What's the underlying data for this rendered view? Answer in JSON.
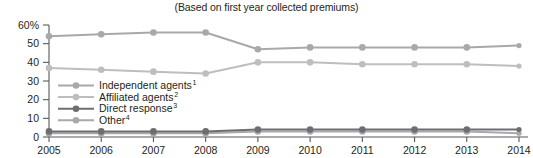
{
  "chart_data": {
    "type": "line",
    "title": "(Based on first year collected premiums)",
    "xlabel": "",
    "ylabel": "",
    "grid": false,
    "legend_position": "inside-left",
    "x": [
      2005,
      2006,
      2007,
      2008,
      2009,
      2010,
      2011,
      2012,
      2013,
      2014
    ],
    "categories": [
      "2005",
      "2006",
      "2007",
      "2008",
      "2009",
      "2010",
      "2011",
      "2012",
      "2013",
      "2014"
    ],
    "ylim": [
      0,
      60
    ],
    "yticks": [
      0,
      10,
      20,
      30,
      40,
      50,
      60
    ],
    "ytick_labels": [
      "0",
      "10",
      "20",
      "30",
      "40",
      "50",
      "60%"
    ],
    "series": [
      {
        "name": "Independent agents",
        "footnote": "1",
        "color": "#a7a9ac",
        "values": [
          54,
          55,
          56,
          56,
          47,
          48,
          48,
          48,
          48,
          49
        ]
      },
      {
        "name": "Affiliated agents",
        "footnote": "2",
        "color": "#bcbec0",
        "values": [
          37,
          36,
          35,
          34,
          40,
          40,
          39,
          39,
          39,
          38
        ]
      },
      {
        "name": "Direct response",
        "footnote": "3",
        "color": "#6d6e71",
        "values": [
          3,
          3,
          3,
          3,
          4,
          4,
          4,
          4,
          4,
          4
        ]
      },
      {
        "name": "Other",
        "footnote": "4",
        "color": "#a7a9ac",
        "values": [
          2,
          2,
          2,
          2,
          3,
          3,
          3,
          3,
          3,
          2
        ]
      }
    ]
  },
  "legend": {
    "items": [
      {
        "label": "Independent agents",
        "sup": "1"
      },
      {
        "label": "Affiliated agents",
        "sup": "2"
      },
      {
        "label": "Direct response",
        "sup": "3"
      },
      {
        "label": "Other",
        "sup": "4"
      }
    ]
  },
  "colors": {
    "axis": "#58595b",
    "text": "#231f20",
    "background": "#ffffff"
  }
}
